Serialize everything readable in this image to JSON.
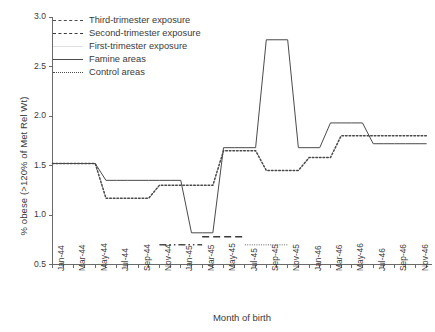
{
  "chart_data": {
    "type": "line",
    "title": "",
    "xlabel": "Month of birth",
    "ylabel": "% obese (>120% of Met Rel Wt)",
    "ylim": [
      0.5,
      3.0
    ],
    "yticks": [
      0.5,
      1.0,
      1.5,
      2.0,
      2.5,
      3.0
    ],
    "ytick_labels": [
      "0.5",
      "1.0",
      "1.5",
      "2.0",
      "2.5",
      "3.0"
    ],
    "grid": false,
    "legend_position": "top-left",
    "x": [
      "Jan-44",
      "Feb-44",
      "Mar-44",
      "Apr-44",
      "May-44",
      "Jun-44",
      "Jul-44",
      "Aug-44",
      "Sep-44",
      "Oct-44",
      "Nov-44",
      "Dec-44",
      "Jan-45",
      "Feb-45",
      "Mar-45",
      "Apr-45",
      "May-45",
      "Jun-45",
      "Jul-45",
      "Aug-45",
      "Sep-45",
      "Oct-45",
      "Nov-45",
      "Dec-45",
      "Jan-46",
      "Feb-46",
      "Mar-46",
      "Apr-46",
      "May-46",
      "Jun-46",
      "Jul-46",
      "Aug-46",
      "Sep-46",
      "Oct-46",
      "Nov-46",
      "Dec-46"
    ],
    "xtick_labels": [
      "Jan-44",
      "Mar-44",
      "May-44",
      "Jul-44",
      "Sep-44",
      "Nov-44",
      "Jan-45",
      "Mar-45",
      "May-45",
      "Jul-45",
      "Sep-45",
      "Nov-45",
      "Jan-46",
      "Mar-46",
      "May-46",
      "Jul-46",
      "Sep-46",
      "Nov-46"
    ],
    "series": [
      {
        "name": "Famine areas",
        "style": "solid",
        "color": "#4a4a4a",
        "values": [
          1.52,
          1.52,
          1.52,
          1.52,
          1.52,
          1.35,
          1.35,
          1.35,
          1.35,
          1.35,
          1.35,
          1.35,
          1.35,
          0.82,
          0.82,
          0.82,
          1.68,
          1.68,
          1.68,
          1.68,
          2.77,
          2.77,
          2.77,
          1.68,
          1.68,
          1.68,
          1.93,
          1.93,
          1.93,
          1.93,
          1.72,
          1.72,
          1.72,
          1.72,
          1.72,
          1.72
        ]
      },
      {
        "name": "Control areas",
        "style": "dotted",
        "color": "#4a4a4a",
        "values": [
          1.52,
          1.52,
          1.52,
          1.52,
          1.52,
          1.17,
          1.17,
          1.17,
          1.17,
          1.17,
          1.3,
          1.3,
          1.3,
          1.3,
          1.3,
          1.3,
          1.65,
          1.65,
          1.65,
          1.65,
          1.45,
          1.45,
          1.45,
          1.45,
          1.58,
          1.58,
          1.58,
          1.8,
          1.8,
          1.8,
          1.8,
          1.8,
          1.8,
          1.8,
          1.8,
          1.8
        ]
      }
    ],
    "exposure_bars": [
      {
        "name": "Third-trimester exposure",
        "style": "dash-dot-dot",
        "color": "#4a4a4a",
        "y": 0.7,
        "x_start": "Nov-44",
        "x_end": "Mar-45"
      },
      {
        "name": "Second-trimester exposure",
        "style": "dashed",
        "color": "#3a3a3a",
        "y": 0.78,
        "x_start": "Mar-45",
        "x_end": "Jul-45"
      },
      {
        "name": "First-trimester exposure",
        "style": "dotted-fine",
        "color": "#9a9a9a",
        "y": 0.7,
        "x_start": "Jul-45",
        "x_end": "Nov-45"
      }
    ],
    "legend": [
      {
        "label": "Third-trimester exposure",
        "style": "dash-dot-dot"
      },
      {
        "label": "Second-trimester exposure",
        "style": "dashed"
      },
      {
        "label": "First-trimester exposure",
        "style": "light-solid"
      },
      {
        "label": "Famine areas",
        "style": "solid"
      },
      {
        "label": "Control areas",
        "style": "dotted"
      }
    ]
  }
}
